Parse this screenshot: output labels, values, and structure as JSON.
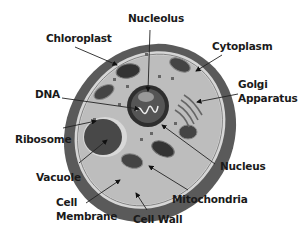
{
  "colors": {
    "cell_wall": "#5a5a5a",
    "membrane_gap": "#c8c8c8",
    "cytoplasm": "#bdbdbd",
    "organelle_dark": "#3a3a3a",
    "nucleus_ring": "#2e2e2e",
    "vacuole": "#4a4a4a",
    "label_text": "#1a1a1a",
    "background": "#ffffff"
  },
  "labels": {
    "nucleolus": "Nucleolus",
    "chloroplast": "Chloroplast",
    "cytoplasm": "Cytoplasm",
    "dna": "DNA",
    "golgi_line1": "Golgi",
    "golgi_line2": "Apparatus",
    "ribosome": "Ribosome",
    "nucleus": "Nucleus",
    "vacuole": "Vacuole",
    "mitochondria": "Mitochondria",
    "cell_membrane_line1": "Cell",
    "cell_membrane_line2": "Membrane",
    "cell_wall": "Cell Wall"
  }
}
